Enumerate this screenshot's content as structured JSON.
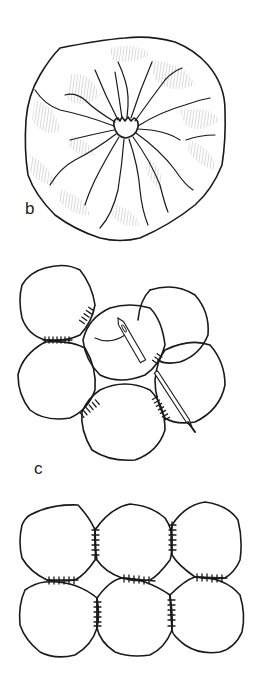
{
  "figure": {
    "panels": [
      {
        "id": "b",
        "label": "b",
        "description": "Gathered fabric circle (puff) viewed from top, gathers radiating from center"
      },
      {
        "id": "c",
        "label": "c",
        "description": "Puffs being whip-stitched together edge to edge with a needle and thread"
      },
      {
        "id": "d",
        "label": "",
        "description": "Six puffs joined in a 3x2 grid with whip-stitched seams"
      }
    ],
    "colors": {
      "ink": "#1a1a1a",
      "shading": "#8a8a8a",
      "background": "#ffffff"
    }
  }
}
